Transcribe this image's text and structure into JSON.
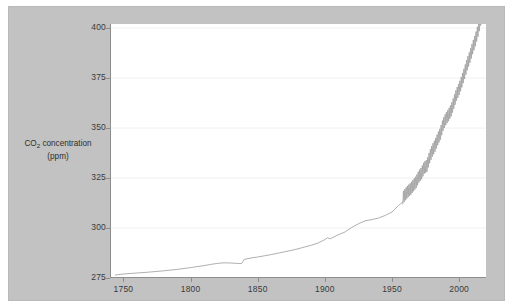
{
  "figure": {
    "background_color": "#c2c2c2",
    "plot_background_color": "#ffffff",
    "line_color": "#9a9a9a",
    "grid_color": "#f0f0f0",
    "axis_color": "#8d8d8d"
  },
  "axis": {
    "y_title_line1": "CO",
    "y_title_subscript": "2",
    "y_title_line1_rest": " concentration",
    "y_title_line2": "(ppm)"
  },
  "chart_data": {
    "type": "line",
    "title": "",
    "subtitle": "",
    "xlabel": "",
    "ylabel": "CO2 concentration (ppm)",
    "xlim": [
      1740,
      2020
    ],
    "ylim": [
      275,
      402
    ],
    "xticks": [
      1750,
      1800,
      1850,
      1900,
      1950,
      2000
    ],
    "xtick_labels": [
      "1750",
      "1800",
      "1850",
      "1900",
      "1950",
      "2000"
    ],
    "yticks": [
      275,
      300,
      325,
      350,
      375,
      400
    ],
    "ytick_labels": [
      "275",
      "300",
      "325",
      "350",
      "375",
      "400"
    ],
    "grid": true,
    "grid_axis": "y",
    "legend": false,
    "legend_position": "none",
    "annotations": [],
    "series": [
      {
        "name": "Atmospheric CO2 concentration",
        "color": "#9a9a9a",
        "x": [
          1744,
          1750,
          1760,
          1770,
          1780,
          1790,
          1800,
          1810,
          1815,
          1820,
          1825,
          1830,
          1835,
          1838,
          1840,
          1842,
          1845,
          1850,
          1855,
          1860,
          1865,
          1870,
          1875,
          1880,
          1885,
          1890,
          1895,
          1900,
          1902,
          1904,
          1906,
          1910,
          1915,
          1920,
          1925,
          1930,
          1935,
          1940,
          1945,
          1950,
          1955,
          1958
        ],
        "y": [
          276.5,
          277.0,
          277.5,
          278.0,
          278.6,
          279.3,
          280.2,
          281.2,
          281.8,
          282.3,
          282.6,
          282.5,
          282.3,
          282.2,
          284.3,
          284.6,
          285.0,
          285.5,
          286.1,
          286.7,
          287.4,
          288.1,
          288.8,
          289.6,
          290.5,
          291.4,
          292.5,
          294.2,
          295.1,
          294.6,
          295.3,
          296.6,
          298.0,
          300.3,
          302.1,
          303.6,
          304.2,
          305.0,
          306.3,
          308.0,
          311.3,
          313.0
        ]
      },
      {
        "name": "Mauna Loa record (with seasonal cycle)",
        "color": "#9a9a9a",
        "note": "monthly sawtooth oscillation of about 6 ppm peak-to-peak superimposed on the rising trend",
        "seasonal_amplitude_ppm": 3.1,
        "x": [
          1958,
          1960,
          1962,
          1964,
          1966,
          1968,
          1970,
          1972,
          1974,
          1976,
          1978,
          1980,
          1982,
          1984,
          1986,
          1988,
          1990,
          1992,
          1994,
          1996,
          1998,
          2000,
          2002,
          2004,
          2006,
          2008,
          2010,
          2012,
          2014,
          2016,
          2018
        ],
        "y": [
          315.0,
          316.9,
          318.4,
          319.6,
          321.4,
          323.0,
          325.7,
          327.4,
          330.2,
          331.1,
          335.4,
          338.7,
          341.1,
          344.4,
          347.2,
          351.6,
          354.4,
          356.4,
          358.8,
          362.6,
          366.7,
          369.5,
          373.3,
          377.5,
          381.9,
          385.6,
          389.9,
          393.8,
          398.6,
          404.2,
          408.5
        ]
      }
    ]
  }
}
